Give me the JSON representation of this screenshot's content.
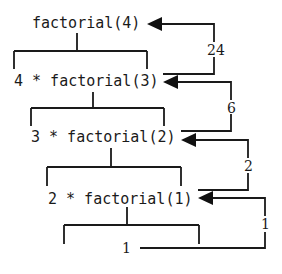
{
  "diagram": {
    "calls": [
      {
        "label": "factorial(4)"
      },
      {
        "label": "4 * factorial(3)"
      },
      {
        "label": "3 * factorial(2)"
      },
      {
        "label": "2 * factorial(1)"
      },
      {
        "label": "1"
      }
    ],
    "returns": [
      {
        "value": "24",
        "from": "4 * factorial(3)",
        "to": "factorial(4)"
      },
      {
        "value": "6",
        "from": "3 * factorial(2)",
        "to": "4 * factorial(3)"
      },
      {
        "value": "2",
        "from": "2 * factorial(1)",
        "to": "3 * factorial(2)"
      },
      {
        "value": "1",
        "from": "1",
        "to": "2 * factorial(1)"
      }
    ],
    "colors": {
      "line": "#1a1a1a",
      "background": "#ffffff"
    }
  }
}
